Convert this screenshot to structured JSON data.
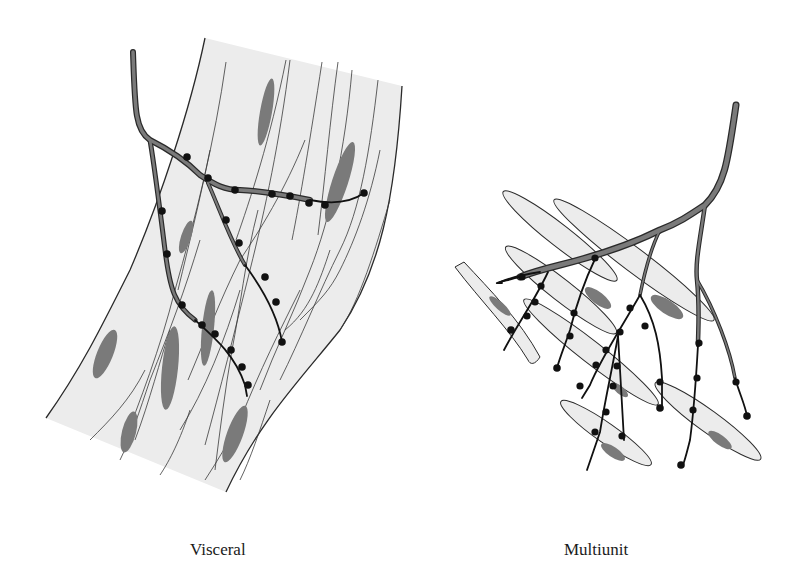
{
  "figure": {
    "panels": [
      {
        "id": "visceral",
        "label": "Visceral",
        "description": "Sheet of smooth muscle with a branching nerve fiber bearing varicosities"
      },
      {
        "id": "multiunit",
        "label": "Multiunit",
        "description": "Separate spindle-shaped muscle cells each innervated by nerve fiber branches with varicosities"
      }
    ],
    "colors": {
      "background": "#ffffff",
      "tissue_fill": "#ececec",
      "nucleus_fill": "#7a7a7a",
      "outline": "#2a2a2a",
      "nerve_fill": "#6e6e6e",
      "varicosity": "#111111"
    }
  }
}
